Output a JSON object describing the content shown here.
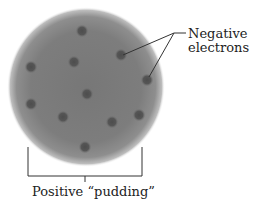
{
  "diagram": {
    "labels": {
      "electrons_line1": "Negative",
      "electrons_line2": "electrons",
      "pudding": "Positive “pudding”"
    },
    "sphere": {
      "cx": 86,
      "cy": 87,
      "rx": 79,
      "ry": 80,
      "center_color": "#7a7a7a",
      "edge_color": "#9a9a9a"
    },
    "electron_color": "#555555",
    "electrons": [
      {
        "x": 82,
        "y": 31
      },
      {
        "x": 74,
        "y": 62
      },
      {
        "x": 31,
        "y": 67
      },
      {
        "x": 121,
        "y": 55
      },
      {
        "x": 147,
        "y": 80
      },
      {
        "x": 87,
        "y": 94
      },
      {
        "x": 31,
        "y": 104
      },
      {
        "x": 63,
        "y": 117
      },
      {
        "x": 112,
        "y": 122
      },
      {
        "x": 139,
        "y": 115
      },
      {
        "x": 85,
        "y": 147
      }
    ],
    "leader_lines": {
      "junction": {
        "x": 174,
        "y": 33
      },
      "tail_end": {
        "x": 186,
        "y": 33
      },
      "targets": [
        {
          "x": 123,
          "y": 55
        },
        {
          "x": 149,
          "y": 77
        }
      ]
    },
    "bracket": {
      "left_x": 28,
      "right_x": 142,
      "top_y": 147,
      "bottom_y": 176,
      "tick_x": 85,
      "tick_bottom_y": 182
    },
    "line_color": "#333333"
  }
}
